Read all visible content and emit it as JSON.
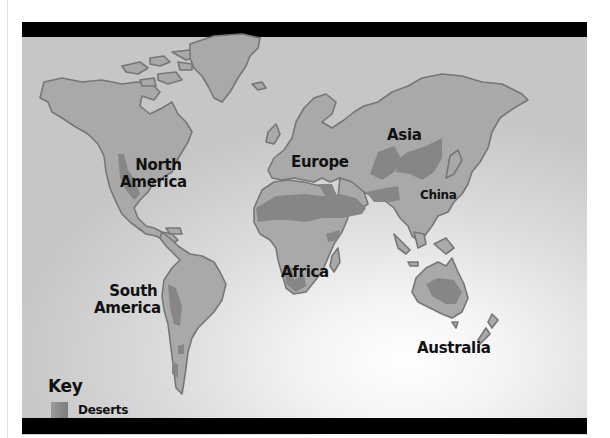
{
  "map": {
    "title": "World Deserts Map",
    "colors": {
      "land": "#a8a8a8",
      "land_outline": "#7a7a7a",
      "desert": "#888888",
      "bars": "#000000"
    },
    "labels": {
      "north_america": [
        "North",
        "America"
      ],
      "south_america": [
        "South",
        "America"
      ],
      "europe": "Europe",
      "asia": "Asia",
      "china": "China",
      "africa": "Africa",
      "australia": "Australia"
    },
    "key": {
      "title": "Key",
      "items": [
        {
          "label": "Deserts",
          "icon": "desert-swatch"
        }
      ]
    }
  }
}
